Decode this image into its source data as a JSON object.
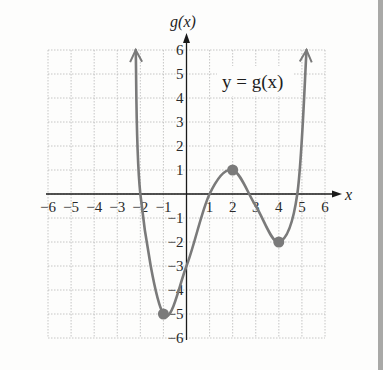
{
  "chart_data": {
    "type": "line",
    "title": "",
    "xlabel": "x",
    "ylabel": "g(x)",
    "function_label": "y = g(x)",
    "xlim": [
      -6,
      6
    ],
    "ylim": [
      -6,
      6
    ],
    "grid": true,
    "x_ticks": [
      "−6",
      "−5",
      "−4",
      "−3",
      "−2",
      "−1",
      "1",
      "2",
      "3",
      "4",
      "5",
      "6"
    ],
    "y_ticks": [
      "6",
      "5",
      "4",
      "3",
      "2",
      "1",
      "−1",
      "−2",
      "−3",
      "−4",
      "−5",
      "−6"
    ],
    "series": [
      {
        "name": "g(x)",
        "color": "#7a7a7a",
        "x": [
          -2.2,
          -2,
          -1,
          0,
          1,
          2,
          3,
          4,
          4.8,
          5.2
        ],
        "y": [
          6,
          0,
          -5,
          -3,
          0,
          1,
          -0.5,
          -2,
          0,
          6
        ],
        "end_arrows": true
      }
    ],
    "marked_points": [
      {
        "x": -1,
        "y": -5,
        "label": "relative minimum"
      },
      {
        "x": 2,
        "y": 1,
        "label": "relative maximum"
      },
      {
        "x": 4,
        "y": -2,
        "label": "relative minimum"
      }
    ],
    "x_intercepts": [
      -2,
      1,
      3,
      4.8
    ],
    "y_intercept": -3
  },
  "colors": {
    "background": "#fdfdfc",
    "grid": "#b8b8b8",
    "axis": "#1a1a1a",
    "curve": "#7a7a7a",
    "point": "#7a7a7a",
    "side_stripe": "#a9a9a7"
  }
}
